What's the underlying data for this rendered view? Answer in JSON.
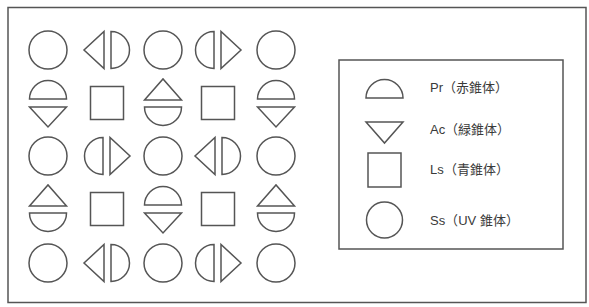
{
  "diagram": {
    "stroke_color": "#555555",
    "background": "#ffffff",
    "grid": {
      "columns": [
        48,
        107,
        163,
        218,
        276
      ],
      "rows": [
        50,
        103,
        156,
        209,
        263
      ],
      "cells": [
        [
          "Ss",
          "Pr-Ac-left",
          "Ss",
          "Pr-Ac-right",
          "Ss"
        ],
        [
          "Pr-Ac-vert",
          "Ls",
          "Ac-Pr-vert",
          "Ls",
          "Pr-Ac-vert"
        ],
        [
          "Ss",
          "Pr-Ac-right",
          "Ss",
          "Pr-Ac-left",
          "Ss"
        ],
        [
          "Ac-Pr-vert",
          "Ls",
          "Pr-Ac-vert",
          "Ls",
          "Ac-Pr-vert"
        ],
        [
          "Ss",
          "Pr-Ac-left",
          "Ss",
          "Pr-Ac-right",
          "Ss"
        ]
      ]
    },
    "legend": {
      "items": [
        {
          "symbol": "semicircle",
          "label": "Pr（赤錐体）"
        },
        {
          "symbol": "inverted-triangle",
          "label": "Ac（緑錐体）"
        },
        {
          "symbol": "square",
          "label": "Ls（青錐体）"
        },
        {
          "symbol": "circle",
          "label": "Ss（UV 錐体）"
        }
      ]
    }
  }
}
